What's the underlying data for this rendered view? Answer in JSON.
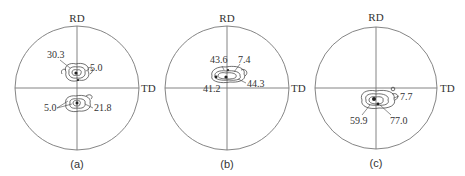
{
  "figure": {
    "axis_labels": {
      "vertical": "RD",
      "horizontal": "TD"
    },
    "panels": [
      {
        "id": "a",
        "caption": "(a)",
        "center": [
          77,
          88
        ],
        "radius": 62,
        "annotations": [
          {
            "text": "30.3",
            "x": 47,
            "y": 58
          },
          {
            "text": "5.0",
            "x": 90,
            "y": 71
          },
          {
            "text": "5.0",
            "x": 44,
            "y": 111
          },
          {
            "text": "21.8",
            "x": 94,
            "y": 111
          }
        ]
      },
      {
        "id": "b",
        "caption": "(b)",
        "center": [
          227,
          88
        ],
        "radius": 62,
        "annotations": [
          {
            "text": "43.6",
            "x": 210,
            "y": 63
          },
          {
            "text": "7.4",
            "x": 238,
            "y": 63
          },
          {
            "text": "44.3",
            "x": 247,
            "y": 87
          },
          {
            "text": "41.2",
            "x": 203,
            "y": 92
          }
        ]
      },
      {
        "id": "c",
        "caption": "(c)",
        "center": [
          376,
          88
        ],
        "radius": 61,
        "annotations": [
          {
            "text": "7.7",
            "x": 400,
            "y": 100
          },
          {
            "text": "59.9",
            "x": 350,
            "y": 124
          },
          {
            "text": "77.0",
            "x": 390,
            "y": 124
          }
        ]
      }
    ]
  }
}
